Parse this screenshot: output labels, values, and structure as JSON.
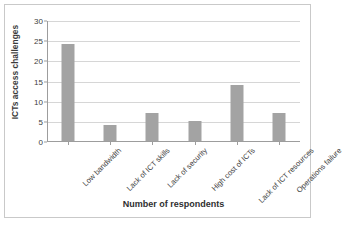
{
  "chart_data": {
    "type": "bar",
    "title": "",
    "subtitle": "",
    "xlabel": "Number of respondents",
    "ylabel": "ICTs access challenges",
    "categories": [
      "Low bandwidth",
      "Lack of ICT skills",
      "Lack of security",
      "High cost of ICTs",
      "Lack of ICT resources",
      "Operations failure"
    ],
    "values": [
      24,
      4,
      7,
      5,
      14,
      7
    ],
    "series": [
      {
        "name": "Respondents",
        "values": [
          24,
          4,
          7,
          5,
          14,
          7
        ]
      }
    ],
    "ylim": [
      0,
      30
    ],
    "yticks": [
      0,
      5,
      10,
      15,
      20,
      25,
      30
    ],
    "ytick_labels": [
      "0",
      "5",
      "10",
      "15",
      "20",
      "25",
      "30"
    ],
    "grid": true,
    "grid_axis": "y",
    "legend": false,
    "legend_position": "none",
    "bar_color": "#a3a3a3",
    "grid_color": "#d6d6d6",
    "axis_color": "#9d9d9d",
    "text_color": "#3e3e3e",
    "background_color": "#ffffff",
    "frame_color": "#c9c9c9",
    "xtick_rotation": -45
  }
}
